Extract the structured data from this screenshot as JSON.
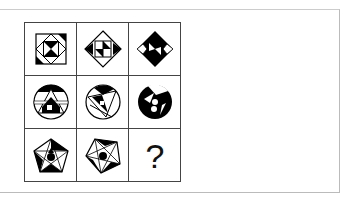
{
  "puzzle": {
    "rows": [
      [
        "square-with-diamond-hourglass",
        "diamond-with-square-arrows",
        "black-diamond-with-hourglass"
      ],
      [
        "circle-with-triangle-pattern",
        "circle-with-rotated-triangle",
        "black-circle-with-dots"
      ],
      [
        "pentagon-with-star-pattern",
        "rotated-pentagon-with-star",
        "missing"
      ]
    ],
    "missing_label": "?"
  }
}
